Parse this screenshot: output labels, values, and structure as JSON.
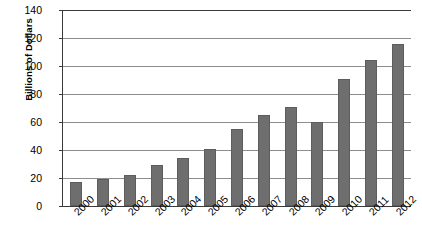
{
  "chart_data": {
    "type": "bar",
    "title": "",
    "subtitle": "",
    "xlabel": "",
    "ylabel": "Billions of Dollars",
    "categories": [
      "2000",
      "2001",
      "2002",
      "2003",
      "2004",
      "2005",
      "2006",
      "2007",
      "2008",
      "2009",
      "2010",
      "2011",
      "2012"
    ],
    "values": [
      17,
      19,
      22,
      29,
      34,
      41,
      55,
      65,
      71,
      60,
      91,
      104,
      116
    ],
    "series": [
      {
        "name": "",
        "values": [
          17,
          19,
          22,
          29,
          34,
          41,
          55,
          65,
          71,
          60,
          91,
          104,
          116
        ]
      }
    ],
    "ylim": [
      0,
      140
    ],
    "ytick_values": [
      0,
      20,
      40,
      60,
      80,
      100,
      120,
      140
    ],
    "ytick_labels": [
      "0",
      "20",
      "40",
      "60",
      "80",
      "100",
      "120",
      "140"
    ],
    "ytick_step": 20,
    "grid": true,
    "grid_axis": "y",
    "legend": false,
    "legend_position": "none",
    "xtick_rotation": -45,
    "bar_color": "#6e6e6e",
    "gridline_color": "#8d8d8d",
    "axis_color": "#3a3a3a",
    "text_color": "#000000",
    "background_color": "#ffffff",
    "annotations": []
  }
}
